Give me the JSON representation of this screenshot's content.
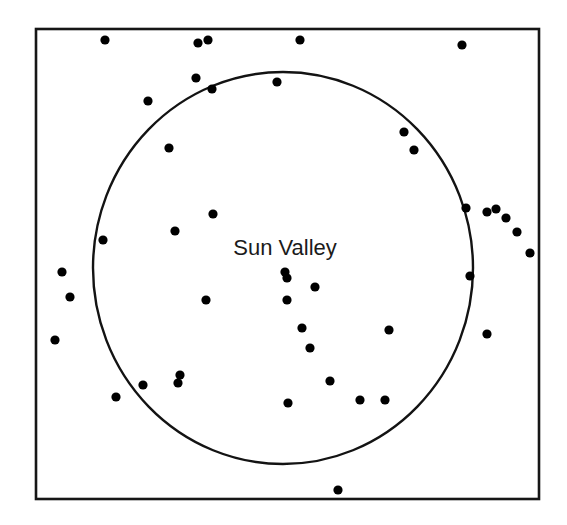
{
  "figure": {
    "title_visible": false,
    "width": 567,
    "height": 525,
    "background_color": "#ffffff"
  },
  "frame": {
    "name": "plot-border",
    "x": 36,
    "y": 29,
    "width": 503,
    "height": 470,
    "stroke_color": "#161616",
    "stroke_width": 2.6
  },
  "region": {
    "label": "Sun Valley",
    "label_x": 285,
    "label_y": 255,
    "label_color": "#1b1b1b",
    "label_font_size": 22,
    "boundary_shape": "ellipse",
    "center_x": 283,
    "center_y": 268,
    "radius_x": 190,
    "radius_y": 196,
    "stroke_color": "#131313",
    "stroke_width": 2.4
  },
  "chart_data": {
    "type": "scatter",
    "title": "Sun Valley",
    "xlabel": "",
    "ylabel": "",
    "grid": false,
    "legend": false,
    "xlim": [
      36,
      539
    ],
    "ylim": [
      29,
      499
    ],
    "axis_ticks": [],
    "annotations": [
      {
        "text": "Sun Valley",
        "x": 285,
        "y": 255
      }
    ],
    "shapes": [
      {
        "type": "rect",
        "name": "plot-border",
        "x": 36,
        "y": 29,
        "width": 503,
        "height": 470
      },
      {
        "type": "ellipse",
        "name": "sun-valley-boundary",
        "cx": 283,
        "cy": 268,
        "rx": 190,
        "ry": 196
      }
    ],
    "point_radius": 4.6,
    "point_color": "#000000",
    "point_count": 46,
    "points": [
      {
        "x": 105,
        "y": 40,
        "inside_region": false
      },
      {
        "x": 198,
        "y": 43,
        "inside_region": false
      },
      {
        "x": 208,
        "y": 40,
        "inside_region": false
      },
      {
        "x": 300,
        "y": 40,
        "inside_region": false
      },
      {
        "x": 462,
        "y": 45,
        "inside_region": false
      },
      {
        "x": 196,
        "y": 78,
        "inside_region": false
      },
      {
        "x": 212,
        "y": 89,
        "inside_region": true
      },
      {
        "x": 277,
        "y": 82,
        "inside_region": true
      },
      {
        "x": 148,
        "y": 101,
        "inside_region": false
      },
      {
        "x": 169,
        "y": 148,
        "inside_region": true
      },
      {
        "x": 404,
        "y": 132,
        "inside_region": true
      },
      {
        "x": 414,
        "y": 150,
        "inside_region": true
      },
      {
        "x": 213,
        "y": 214,
        "inside_region": true
      },
      {
        "x": 175,
        "y": 231,
        "inside_region": true
      },
      {
        "x": 103,
        "y": 240,
        "inside_region": true
      },
      {
        "x": 466,
        "y": 208,
        "inside_region": true
      },
      {
        "x": 487,
        "y": 212,
        "inside_region": false
      },
      {
        "x": 496,
        "y": 209,
        "inside_region": false
      },
      {
        "x": 506,
        "y": 218,
        "inside_region": false
      },
      {
        "x": 517,
        "y": 232,
        "inside_region": false
      },
      {
        "x": 530,
        "y": 253,
        "inside_region": false
      },
      {
        "x": 62,
        "y": 272,
        "inside_region": false
      },
      {
        "x": 70,
        "y": 297,
        "inside_region": false
      },
      {
        "x": 55,
        "y": 340,
        "inside_region": false
      },
      {
        "x": 285,
        "y": 272,
        "inside_region": true
      },
      {
        "x": 287,
        "y": 278,
        "inside_region": true
      },
      {
        "x": 315,
        "y": 287,
        "inside_region": true
      },
      {
        "x": 287,
        "y": 300,
        "inside_region": true
      },
      {
        "x": 206,
        "y": 300,
        "inside_region": true
      },
      {
        "x": 470,
        "y": 276,
        "inside_region": true
      },
      {
        "x": 302,
        "y": 328,
        "inside_region": true
      },
      {
        "x": 389,
        "y": 330,
        "inside_region": true
      },
      {
        "x": 487,
        "y": 334,
        "inside_region": false
      },
      {
        "x": 310,
        "y": 348,
        "inside_region": true
      },
      {
        "x": 180,
        "y": 375,
        "inside_region": true
      },
      {
        "x": 178,
        "y": 383,
        "inside_region": true
      },
      {
        "x": 143,
        "y": 385,
        "inside_region": true
      },
      {
        "x": 330,
        "y": 381,
        "inside_region": true
      },
      {
        "x": 116,
        "y": 397,
        "inside_region": false
      },
      {
        "x": 288,
        "y": 403,
        "inside_region": true
      },
      {
        "x": 360,
        "y": 400,
        "inside_region": true
      },
      {
        "x": 385,
        "y": 400,
        "inside_region": true
      },
      {
        "x": 338,
        "y": 490,
        "inside_region": false
      }
    ]
  }
}
